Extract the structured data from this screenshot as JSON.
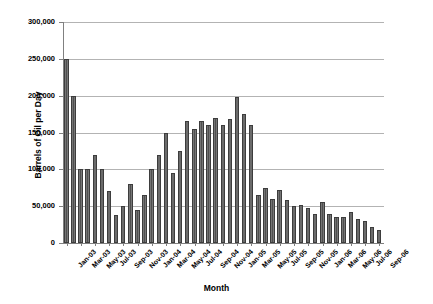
{
  "chart_data": {
    "type": "bar",
    "title": "",
    "xlabel": "Month",
    "ylabel": "Barrels of Oil per Day",
    "ylim": [
      0,
      300000
    ],
    "ytick_values": [
      0,
      50000,
      100000,
      150000,
      200000,
      250000,
      300000
    ],
    "ytick_labels": [
      "0",
      "50,000",
      "100,000",
      "150,000",
      "200,000",
      "250,000",
      "300,000"
    ],
    "grid": true,
    "legend": "none",
    "categories": [
      "Jan-03",
      "Feb-03",
      "Mar-03",
      "Apr-03",
      "May-03",
      "Jun-03",
      "Jul-03",
      "Aug-03",
      "Sep-03",
      "Oct-03",
      "Nov-03",
      "Dec-03",
      "Jan-04",
      "Feb-04",
      "Mar-04",
      "Apr-04",
      "May-04",
      "Jun-04",
      "Jul-04",
      "Aug-04",
      "Sep-04",
      "Oct-04",
      "Nov-04",
      "Dec-04",
      "Jan-05",
      "Feb-05",
      "Mar-05",
      "Apr-05",
      "May-05",
      "Jun-05",
      "Jul-05",
      "Aug-05",
      "Sep-05",
      "Oct-05",
      "Nov-05",
      "Dec-05",
      "Jan-06",
      "Feb-06",
      "Mar-06",
      "Apr-06",
      "May-06",
      "Jun-06",
      "Jul-06",
      "Aug-06",
      "Sep-06"
    ],
    "xtick_labels": [
      "Jan-03",
      "Mar-03",
      "May-03",
      "Jul-03",
      "Sep-03",
      "Nov-03",
      "Jan-04",
      "Mar-04",
      "May-04",
      "Jul-04",
      "Sep-04",
      "Nov-04",
      "Jan-05",
      "Mar-05",
      "May-05",
      "Jul-05",
      "Sep-05",
      "Nov-05",
      "Jan-06",
      "Mar-06",
      "May-06",
      "Jul-06",
      "Sep-06"
    ],
    "xtick_indices": [
      0,
      2,
      4,
      6,
      8,
      10,
      12,
      14,
      16,
      18,
      20,
      22,
      24,
      26,
      28,
      30,
      32,
      34,
      36,
      38,
      40,
      42,
      44
    ],
    "values": [
      250000,
      200000,
      100000,
      100000,
      120000,
      100000,
      70000,
      38000,
      50000,
      80000,
      45000,
      65000,
      100000,
      120000,
      150000,
      95000,
      125000,
      165000,
      155000,
      165000,
      160000,
      170000,
      160000,
      168000,
      198000,
      175000,
      160000,
      65000,
      75000,
      60000,
      72000,
      58000,
      50000,
      52000,
      48000,
      40000,
      55000,
      40000,
      35000,
      35000,
      42000,
      32000,
      30000,
      22000,
      18000
    ]
  },
  "colors": {
    "bar_fill": "#5a5a5a",
    "bar_edge": "#3d3d3d",
    "gridline": "#b3b3b3",
    "axis": "#808080",
    "text": "#000000",
    "background": "#ffffff"
  }
}
